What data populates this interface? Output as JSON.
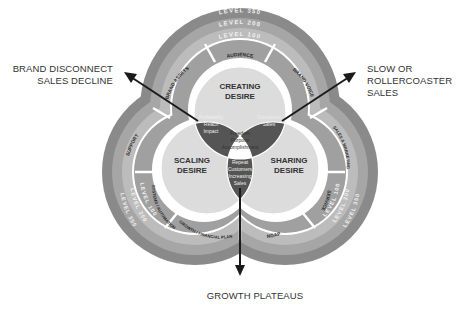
{
  "diagram": {
    "levels": [
      {
        "label": "LEVEL 350",
        "color": "#8a8a8a"
      },
      {
        "label": "LEVEL 200",
        "color": "#a6a6a6"
      },
      {
        "label": "LEVEL 100",
        "color": "#bcbcbc"
      }
    ],
    "levels_bottom": {
      "left": [
        "LEVEL 350",
        "LEVEL 200",
        "LEVEL 100"
      ],
      "right": [
        "LEVEL 350",
        "LEVEL 200",
        "LEVEL 100"
      ]
    },
    "segments": [
      {
        "label": "AUDIENCE"
      },
      {
        "label": "BRAND ASSETS"
      },
      {
        "label": "BRAND VOICE"
      },
      {
        "label": "SUPPORT"
      },
      {
        "label": "SYSTEMS / AUTOMATION"
      },
      {
        "label": "SALES & MARKETING"
      },
      {
        "label": "SERVICE"
      },
      {
        "label": "GROWTH / FINANCIAL PLAN"
      },
      {
        "label": "NGAP"
      }
    ],
    "circles": {
      "top": {
        "line1": "CREATING",
        "line2": "DESIRE"
      },
      "left": {
        "line1": "SCALING",
        "line2": "DESIRE"
      },
      "right": {
        "line1": "SHARING",
        "line2": "DESIRE"
      }
    },
    "overlaps": {
      "top_left": [
        "Profitability",
        "Reach",
        "Impact"
      ],
      "top_right": [
        "Consistent",
        "Sales"
      ],
      "bottom": [
        "Repeat",
        "Customers",
        "Increasing",
        "Sales"
      ],
      "center": [
        "Freedom",
        "Purpose",
        "Accomplishment"
      ]
    },
    "colors": {
      "circle_fill": "#dcdcdc",
      "overlap_fill": "#555555",
      "center_fill": "#ffffff",
      "segment_fill": "#a0a0a0",
      "ring_outer": "#8a8a8a",
      "ring_mid": "#a6a6a6",
      "ring_inner": "#bcbcbc",
      "arrow": "#1a1a1a",
      "text_dark": "#333333"
    }
  },
  "callouts": {
    "left": {
      "line1": "BRAND DISCONNECT",
      "line2": "SALES DECLINE"
    },
    "right": {
      "line1": "SLOW OR",
      "line2": "ROLLERCOASTER",
      "line3": "SALES"
    },
    "bottom": {
      "line1": "GROWTH PLATEAUS"
    }
  }
}
